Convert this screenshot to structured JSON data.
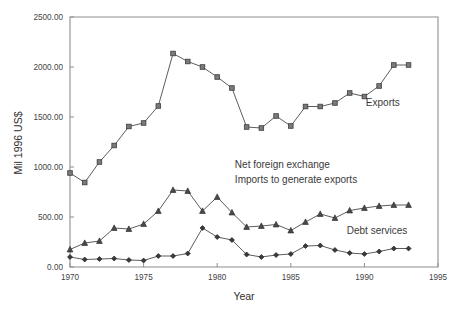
{
  "chart_data": {
    "type": "line",
    "title": "",
    "xlabel": "Year",
    "ylabel": "Mil 1996 US$",
    "xlim": [
      1970,
      1995
    ],
    "ylim": [
      0,
      2500
    ],
    "grid": false,
    "legend_position": "inline-annotations",
    "x_tick_labels": [
      "1970",
      "1975",
      "1980",
      "1985",
      "1990",
      "1995"
    ],
    "x_ticks": [
      1970,
      1975,
      1980,
      1985,
      1990,
      1995
    ],
    "y_tick_labels": [
      "0.00",
      "500.00",
      "1000.00",
      "1500.00",
      "2000.00",
      "2500.00"
    ],
    "y_ticks": [
      0,
      500,
      1000,
      1500,
      2000,
      2500
    ],
    "x": [
      1970,
      1971,
      1972,
      1973,
      1974,
      1975,
      1976,
      1977,
      1978,
      1979,
      1980,
      1981,
      1982,
      1983,
      1984,
      1985,
      1986,
      1987,
      1988,
      1989,
      1990,
      1991,
      1992,
      1993
    ],
    "series": [
      {
        "name": "Exports",
        "marker": "square",
        "values": [
          940,
          845,
          1050,
          1215,
          1405,
          1440,
          1610,
          2135,
          2055,
          2000,
          1900,
          1790,
          1400,
          1390,
          1510,
          1410,
          1605,
          1605,
          1640,
          1740,
          1705,
          1810,
          2020,
          2020
        ]
      },
      {
        "name": "Imports to generate exports",
        "marker": "triangle",
        "values": [
          175,
          240,
          260,
          390,
          380,
          430,
          560,
          770,
          760,
          560,
          700,
          545,
          400,
          410,
          425,
          365,
          450,
          530,
          490,
          565,
          590,
          610,
          620,
          620
        ]
      },
      {
        "name": "Debt services",
        "marker": "diamond",
        "values": [
          100,
          75,
          80,
          85,
          70,
          65,
          110,
          110,
          135,
          390,
          300,
          270,
          125,
          100,
          120,
          130,
          210,
          215,
          170,
          140,
          130,
          155,
          185,
          185
        ]
      }
    ],
    "annotations": [
      {
        "text": "Exports",
        "x": 1990.1,
        "y": 1610
      },
      {
        "text": "Net foreign exchange",
        "x": 1981.2,
        "y": 990
      },
      {
        "text": "Imports to generate exports",
        "x": 1981.2,
        "y": 840
      },
      {
        "text": "Debt services",
        "x": 1988.8,
        "y": 330
      }
    ]
  }
}
